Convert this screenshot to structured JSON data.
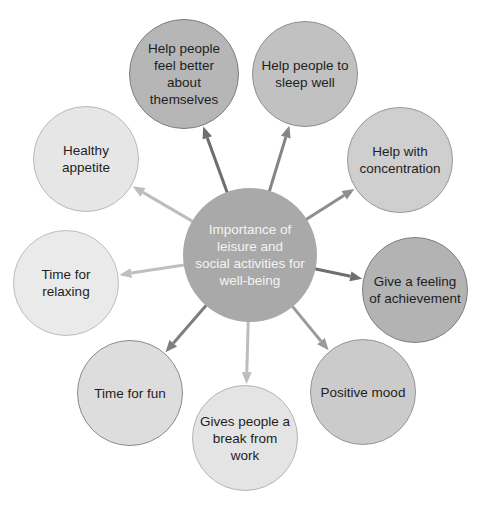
{
  "diagram": {
    "type": "mind-map",
    "center": {
      "label": "Importance of leisure and social activities for well-being",
      "lines": [
        "Importance of",
        "leisure and",
        "social activities for",
        "well-being"
      ],
      "cx": 250,
      "cy": 255,
      "r": 67,
      "fill": "#a9a9a9"
    },
    "nodes": [
      {
        "id": "feel-better",
        "label": "Help people feel better about themselves",
        "cx": 184,
        "cy": 74,
        "r": 55,
        "fill": "#b6b6b6",
        "stroke": "#7c7c7c",
        "arrow": "#6e6e6e"
      },
      {
        "id": "sleep-well",
        "label": "Help people to sleep well",
        "cx": 305,
        "cy": 74,
        "r": 53,
        "fill": "#c1c1c1",
        "stroke": "#8f8f8f",
        "arrow": "#858585"
      },
      {
        "id": "concentration",
        "label": "Help with concentration",
        "cx": 400,
        "cy": 160,
        "r": 53,
        "fill": "#cfcfcf",
        "stroke": "#999999",
        "arrow": "#8e8e8e"
      },
      {
        "id": "achievement",
        "label": "Give a feeling of achievement",
        "cx": 415,
        "cy": 290,
        "r": 53,
        "fill": "#b3b3b3",
        "stroke": "#7e7e7e",
        "arrow": "#6e6e6e"
      },
      {
        "id": "positive-mood",
        "label": "Positive mood",
        "cx": 363,
        "cy": 392,
        "r": 53,
        "fill": "#cbcbcb",
        "stroke": "#969696",
        "arrow": "#9a9a9a"
      },
      {
        "id": "break-from-work",
        "label": "Gives people a break from work",
        "cx": 245,
        "cy": 438,
        "r": 53,
        "fill": "#e4e4e4",
        "stroke": "#b5b5b5",
        "arrow": "#bdbdbd"
      },
      {
        "id": "time-for-fun",
        "label": "Time for fun",
        "cx": 130,
        "cy": 393,
        "r": 53,
        "fill": "#dddddd",
        "stroke": "#8a8a8a",
        "arrow": "#7e7e7e"
      },
      {
        "id": "time-for-relaxing",
        "label": "Time for relaxing",
        "cx": 66,
        "cy": 283,
        "r": 53,
        "fill": "#eaeaea",
        "stroke": "#bdbdbd",
        "arrow": "#bfbfbf"
      },
      {
        "id": "healthy-appetite",
        "label": "Healthy appetite",
        "cx": 86,
        "cy": 159,
        "r": 53,
        "fill": "#e6e6e6",
        "stroke": "#b9b9b9",
        "arrow": "#bdbdbd"
      }
    ]
  }
}
